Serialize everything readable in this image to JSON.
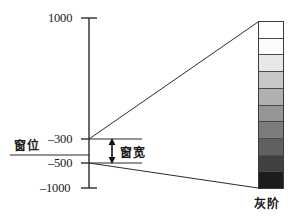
{
  "figure": {
    "axis": {
      "ticks": [
        {
          "name": "tick-1000",
          "label": "1000",
          "value": 1000
        },
        {
          "name": "tick-m300",
          "label": "–300",
          "value": -300
        },
        {
          "name": "tick-m500",
          "label": "–500",
          "value": -500
        },
        {
          "name": "tick-m1000",
          "label": "–1000",
          "value": -1000
        }
      ],
      "range": [
        -1000,
        1000
      ]
    },
    "annotations": {
      "window_level": "窗位",
      "window_width": "窗宽",
      "grayscale": "灰阶"
    },
    "window": {
      "level_value": -300,
      "width_top": -300,
      "width_bottom": -500
    },
    "colors": {
      "line": "#2b2b2b",
      "text": "#1a1a1a",
      "bar_border": "#3b3b3b"
    }
  },
  "chart_data": {
    "type": "bar",
    "title": "",
    "xlabel": "",
    "ylabel": "",
    "ylim": [
      -1000,
      1000
    ],
    "categories": [
      "step-1",
      "step-2",
      "step-3",
      "step-4",
      "step-5",
      "step-6",
      "step-7",
      "step-8",
      "step-9",
      "step-10"
    ],
    "values": [
      255,
      252,
      232,
      200,
      176,
      150,
      124,
      96,
      64,
      28
    ],
    "grayscale_steps": [
      "#ffffff",
      "#fcfcfc",
      "#e8e8e8",
      "#c8c8c8",
      "#b0b0b0",
      "#969696",
      "#7c7c7c",
      "#606060",
      "#404040",
      "#1c1c1c"
    ],
    "axis_ticks": [
      1000,
      -300,
      -500,
      -1000
    ],
    "annotations": [
      "窗位",
      "窗宽",
      "灰阶"
    ]
  }
}
